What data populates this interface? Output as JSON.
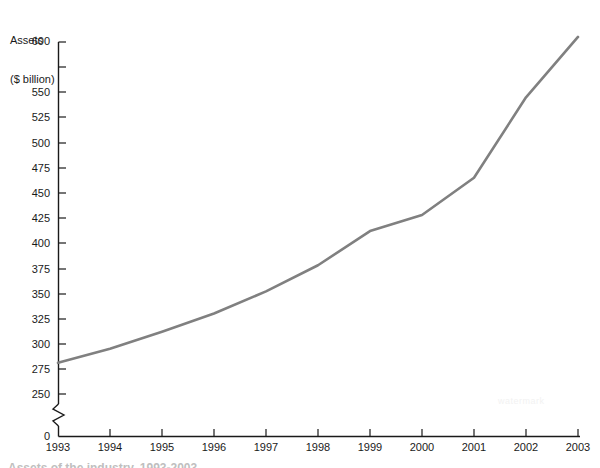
{
  "chart_data": {
    "type": "line",
    "title": "",
    "subtitle": "",
    "xlabel": "",
    "ylabel": "Assets\n($ billion)",
    "ylabel_lines": [
      "Assets",
      "($ billion)"
    ],
    "categories": [
      "1993",
      "1994",
      "1995",
      "1996",
      "1997",
      "1998",
      "1999",
      "2000",
      "2001",
      "2002",
      "2003"
    ],
    "x": [
      1993,
      1994,
      1995,
      1996,
      1997,
      1998,
      1999,
      2000,
      2001,
      2002,
      2003
    ],
    "values": [
      281,
      295,
      312,
      330,
      352,
      378,
      412,
      428,
      465,
      545,
      605
    ],
    "series": [
      {
        "name": "Assets",
        "values": [
          281,
          295,
          312,
          330,
          352,
          378,
          412,
          428,
          465,
          545,
          605
        ],
        "color": "#808080"
      }
    ],
    "ylim": [
      250,
      610
    ],
    "y_ticks": [
      250,
      275,
      300,
      325,
      350,
      375,
      400,
      425,
      450,
      475,
      500,
      525,
      550,
      575,
      600
    ],
    "y_tick_labels": [
      "250",
      "275",
      "300",
      "325",
      "350",
      "375",
      "400",
      "425",
      "450",
      "475",
      "500",
      "525",
      "550",
      "",
      "600"
    ],
    "y_origin_label": "0",
    "axis_break": true,
    "axis_break_note": "zigzag break on y-axis between 0 and 250",
    "xlim": [
      1993,
      2003
    ],
    "x_tick_labels": [
      "1993",
      "1994",
      "1995",
      "1996",
      "1997",
      "1998",
      "1999",
      "2000",
      "2001",
      "2002",
      "2003"
    ],
    "grid": false,
    "legend": false,
    "legend_position": "none",
    "line_color": "#808080",
    "axis_color": "#1a1a1a"
  },
  "caption": {
    "text": "Assets of the industry, 1993-2003"
  },
  "watermark": {
    "text": "watermark"
  }
}
